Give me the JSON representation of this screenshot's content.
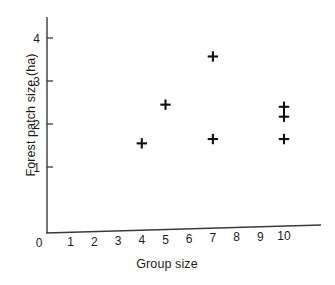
{
  "chart_data": {
    "type": "scatter",
    "title": "",
    "xlabel": "Group size",
    "ylabel": "Forest patch size (ha)",
    "xlim": [
      0,
      11.5
    ],
    "ylim": [
      0,
      4.4
    ],
    "grid": false,
    "legend": null,
    "xticks": [
      0,
      1,
      2,
      3,
      4,
      5,
      6,
      7,
      8,
      9,
      10
    ],
    "xtick_labels": [
      "0",
      "1",
      "2",
      "3",
      "4",
      "5",
      "6",
      "7",
      "8",
      "9",
      "10"
    ],
    "yticks": [
      1,
      2,
      3,
      4
    ],
    "ytick_labels": [
      "1",
      "2",
      "3",
      "4"
    ],
    "marker": "plus",
    "marker_color": "#111111",
    "points": [
      {
        "x": 4,
        "y": 1.55
      },
      {
        "x": 5,
        "y": 2.45
      },
      {
        "x": 7,
        "y": 3.57
      },
      {
        "x": 7,
        "y": 1.65
      },
      {
        "x": 10,
        "y": 2.4
      },
      {
        "x": 10,
        "y": 2.17
      },
      {
        "x": 10,
        "y": 1.65
      }
    ],
    "series": [
      {
        "name": "Forest patch size vs group size",
        "x": [
          4,
          5,
          7,
          7,
          10,
          10,
          10
        ],
        "values": [
          1.55,
          2.45,
          3.57,
          1.65,
          2.4,
          2.17,
          1.65
        ]
      }
    ],
    "axis_color": "#3a3a3a"
  }
}
